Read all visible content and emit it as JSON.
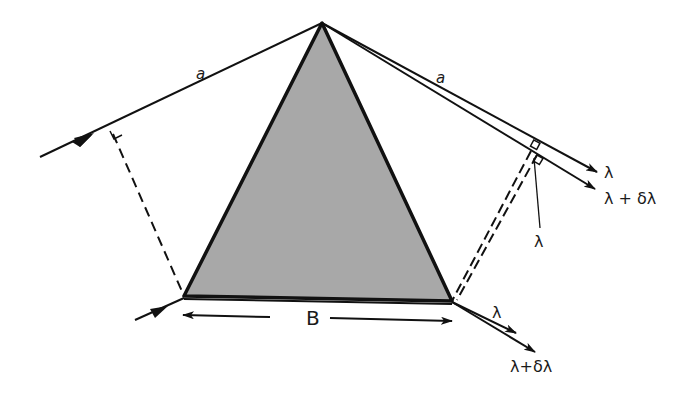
{
  "diagram": {
    "colors": {
      "prism_fill": "#a8a8a8",
      "stroke": "#111111",
      "background": "#ffffff"
    },
    "labels": {
      "side_left": "a",
      "side_right": "a",
      "out_lambda": "λ",
      "out_lambda_dl": "λ + δλ",
      "wavefront_lambda": "λ",
      "base": "B",
      "bottom_lambda": "λ",
      "bottom_lambda_dl": "λ+δλ"
    }
  }
}
